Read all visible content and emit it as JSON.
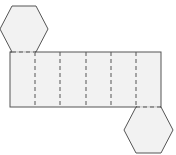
{
  "diagram": {
    "title": "",
    "colors": {
      "fill": "#f2f2f2",
      "stroke": "#555555",
      "background": "#ffffff"
    },
    "faces": {
      "top_hexagon": {
        "cx": 24,
        "cy": 29,
        "r": 24
      },
      "bottom_hexagon": {
        "cx": 148,
        "cy": 130,
        "r": 24
      },
      "lateral_rectangles": 6
    }
  }
}
